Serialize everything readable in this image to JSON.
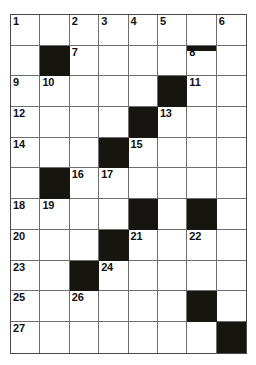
{
  "puzzle": {
    "type": "crossword-grid",
    "title": "",
    "rows": 11,
    "columns": 8,
    "colors": {
      "background": "#ffffff",
      "cell_fill": "#ffffff",
      "block_fill": "#17150f",
      "grid_line": "#6e6e6e",
      "border": "#4a4a4a",
      "number_text": "#101010"
    },
    "cell_width_px": 29.4,
    "cell_height_px": 30.7,
    "legend": {
      "block": "black filled square (no letter)",
      "open": "white square (letter entry)",
      "bar": "thick black bar separating entries"
    },
    "clue_numbers_in_reading_order": [
      1,
      2,
      3,
      4,
      5,
      6,
      7,
      8,
      9,
      10,
      11,
      12,
      13,
      14,
      15,
      16,
      17,
      18,
      19,
      20,
      21,
      22,
      23,
      24,
      25,
      26,
      27
    ],
    "grid": [
      [
        {
          "state": "open",
          "number": "1"
        },
        {
          "state": "open",
          "number": ""
        },
        {
          "state": "open",
          "number": "2"
        },
        {
          "state": "open",
          "number": "3"
        },
        {
          "state": "open",
          "number": "4"
        },
        {
          "state": "open",
          "number": "5"
        },
        {
          "state": "open",
          "number": ""
        },
        {
          "state": "open",
          "number": "6"
        }
      ],
      [
        {
          "state": "open",
          "number": ""
        },
        {
          "state": "block",
          "number": ""
        },
        {
          "state": "open",
          "number": "7"
        },
        {
          "state": "open",
          "number": ""
        },
        {
          "state": "open",
          "number": ""
        },
        {
          "state": "open",
          "number": ""
        },
        {
          "state": "open",
          "number": "8",
          "bar_top": true
        },
        {
          "state": "open",
          "number": ""
        }
      ],
      [
        {
          "state": "open",
          "number": "9"
        },
        {
          "state": "open",
          "number": "10"
        },
        {
          "state": "open",
          "number": ""
        },
        {
          "state": "open",
          "number": ""
        },
        {
          "state": "open",
          "number": ""
        },
        {
          "state": "block",
          "number": ""
        },
        {
          "state": "open",
          "number": "11"
        },
        {
          "state": "open",
          "number": ""
        }
      ],
      [
        {
          "state": "open",
          "number": "12"
        },
        {
          "state": "open",
          "number": ""
        },
        {
          "state": "open",
          "number": ""
        },
        {
          "state": "open",
          "number": ""
        },
        {
          "state": "block",
          "number": ""
        },
        {
          "state": "open",
          "number": "13"
        },
        {
          "state": "open",
          "number": ""
        },
        {
          "state": "open",
          "number": ""
        }
      ],
      [
        {
          "state": "open",
          "number": "14"
        },
        {
          "state": "open",
          "number": ""
        },
        {
          "state": "open",
          "number": ""
        },
        {
          "state": "block",
          "number": ""
        },
        {
          "state": "open",
          "number": "15"
        },
        {
          "state": "open",
          "number": ""
        },
        {
          "state": "open",
          "number": ""
        },
        {
          "state": "open",
          "number": ""
        }
      ],
      [
        {
          "state": "open",
          "number": ""
        },
        {
          "state": "block",
          "number": ""
        },
        {
          "state": "open",
          "number": "16"
        },
        {
          "state": "open",
          "number": "17"
        },
        {
          "state": "open",
          "number": ""
        },
        {
          "state": "open",
          "number": ""
        },
        {
          "state": "open",
          "number": ""
        },
        {
          "state": "open",
          "number": ""
        }
      ],
      [
        {
          "state": "open",
          "number": "18"
        },
        {
          "state": "open",
          "number": "19"
        },
        {
          "state": "open",
          "number": ""
        },
        {
          "state": "open",
          "number": ""
        },
        {
          "state": "block",
          "number": ""
        },
        {
          "state": "open",
          "number": ""
        },
        {
          "state": "block",
          "number": ""
        },
        {
          "state": "open",
          "number": ""
        }
      ],
      [
        {
          "state": "open",
          "number": "20"
        },
        {
          "state": "open",
          "number": ""
        },
        {
          "state": "open",
          "number": ""
        },
        {
          "state": "block",
          "number": ""
        },
        {
          "state": "open",
          "number": "21"
        },
        {
          "state": "open",
          "number": ""
        },
        {
          "state": "open",
          "number": "22"
        },
        {
          "state": "open",
          "number": ""
        }
      ],
      [
        {
          "state": "open",
          "number": "23"
        },
        {
          "state": "open",
          "number": ""
        },
        {
          "state": "block",
          "number": ""
        },
        {
          "state": "open",
          "number": "24"
        },
        {
          "state": "open",
          "number": ""
        },
        {
          "state": "open",
          "number": ""
        },
        {
          "state": "open",
          "number": ""
        },
        {
          "state": "open",
          "number": ""
        }
      ],
      [
        {
          "state": "open",
          "number": "25"
        },
        {
          "state": "open",
          "number": ""
        },
        {
          "state": "open",
          "number": "26"
        },
        {
          "state": "open",
          "number": ""
        },
        {
          "state": "open",
          "number": ""
        },
        {
          "state": "open",
          "number": ""
        },
        {
          "state": "block",
          "number": ""
        },
        {
          "state": "open",
          "number": ""
        }
      ],
      [
        {
          "state": "open",
          "number": "27"
        },
        {
          "state": "open",
          "number": ""
        },
        {
          "state": "open",
          "number": ""
        },
        {
          "state": "open",
          "number": ""
        },
        {
          "state": "open",
          "number": ""
        },
        {
          "state": "open",
          "number": ""
        },
        {
          "state": "open",
          "number": ""
        },
        {
          "state": "block",
          "number": ""
        }
      ]
    ]
  }
}
